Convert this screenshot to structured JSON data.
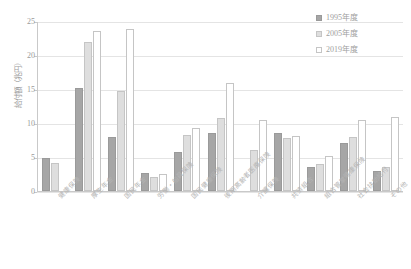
{
  "chart_data": {
    "type": "bar",
    "title": "",
    "xlabel": "",
    "ylabel": "給付額（兆円）",
    "ylim": [
      0,
      25
    ],
    "ytick_labels": [
      "25",
      "20",
      "15",
      "10",
      "5",
      "0"
    ],
    "ytick_values": [
      25,
      20,
      15,
      10,
      5,
      0
    ],
    "grid": true,
    "legend_position": "top-right",
    "categories": [
      "健康保険",
      "厚生年金",
      "国民年金",
      "労働・船員保険",
      "国民健康保険",
      "後期高齢者医療保険",
      "介護保険",
      "共済組合",
      "組合管掌健康保険",
      "社会扶助給付",
      "その他"
    ],
    "series": [
      {
        "name": "1995年度",
        "color": "#a6a6a6",
        "values": [
          4.8,
          15.2,
          8.0,
          2.6,
          5.7,
          8.6,
          0,
          8.6,
          3.6,
          7.1,
          2.9
        ]
      },
      {
        "name": "2005年度",
        "color": "#dedede",
        "values": [
          4.1,
          21.9,
          14.7,
          2.1,
          8.2,
          10.7,
          6.1,
          7.8,
          3.9,
          8.0,
          3.6
        ]
      },
      {
        "name": "2019年度",
        "color": "#ffffff",
        "values": [
          0,
          23.6,
          23.8,
          2.5,
          9.2,
          15.9,
          10.5,
          8.1,
          5.1,
          10.5,
          10.9
        ]
      }
    ]
  },
  "legend": {
    "items": [
      {
        "label": "1995年度"
      },
      {
        "label": "2005年度"
      },
      {
        "label": "2019年度"
      }
    ]
  }
}
